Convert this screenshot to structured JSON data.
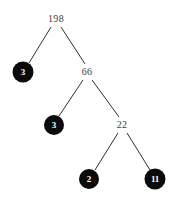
{
  "figure": {
    "kind": "binary-tree-diagram",
    "width": 170,
    "height": 199,
    "background_color": "#ffffff",
    "edge_color": "#2e2e2e",
    "text_node_color": "#3b3b3b",
    "circle_node_fill": "#0b0b0b",
    "circle_node_text_color": "#ffffff"
  },
  "nodes": [
    {
      "id": "n198",
      "label": "198",
      "style": "text",
      "x": 56,
      "y": 19,
      "radius": 0
    },
    {
      "id": "n3a",
      "label": "3",
      "style": "circle",
      "x": 23,
      "y": 72,
      "radius": 10.5
    },
    {
      "id": "n66",
      "label": "66",
      "style": "text",
      "x": 87,
      "y": 72,
      "radius": 0
    },
    {
      "id": "n3b",
      "label": "3",
      "style": "circle",
      "x": 54,
      "y": 125,
      "radius": 10
    },
    {
      "id": "n22",
      "label": "22",
      "style": "text",
      "x": 122,
      "y": 125,
      "radius": 0
    },
    {
      "id": "n2",
      "label": "2",
      "style": "circle",
      "x": 89,
      "y": 179,
      "radius": 10
    },
    {
      "id": "n11",
      "label": "11",
      "style": "circle",
      "x": 155,
      "y": 179,
      "radius": 10.5
    }
  ],
  "edges": [
    {
      "from": "n198",
      "to": "n3a",
      "x1": 51,
      "y1": 27,
      "x2": 29,
      "y2": 63
    },
    {
      "from": "n198",
      "to": "n66",
      "x1": 61,
      "y1": 27,
      "x2": 85,
      "y2": 64
    },
    {
      "from": "n66",
      "to": "n3b",
      "x1": 83,
      "y1": 80,
      "x2": 59,
      "y2": 116
    },
    {
      "from": "n66",
      "to": "n22",
      "x1": 92,
      "y1": 80,
      "x2": 119,
      "y2": 117
    },
    {
      "from": "n22",
      "to": "n2",
      "x1": 118,
      "y1": 133,
      "x2": 95,
      "y2": 170
    },
    {
      "from": "n22",
      "to": "n11",
      "x1": 127,
      "y1": 133,
      "x2": 150,
      "y2": 170
    }
  ]
}
